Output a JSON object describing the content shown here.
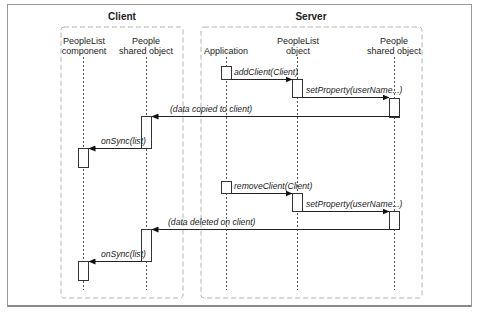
{
  "diagram": {
    "type": "sequence",
    "groups": [
      {
        "id": "client",
        "title": "Client"
      },
      {
        "id": "server",
        "title": "Server"
      }
    ],
    "lifelines": [
      {
        "id": "peoplelist_component",
        "group": "client",
        "label_line1": "PeopleList",
        "label_line2": "component"
      },
      {
        "id": "client_people",
        "group": "client",
        "label_line1": "People",
        "label_line2": "shared object"
      },
      {
        "id": "application",
        "group": "server",
        "label_line1": "Application",
        "label_line2": ""
      },
      {
        "id": "peoplelist_object",
        "group": "server",
        "label_line1": "PeopleList",
        "label_line2": "object"
      },
      {
        "id": "server_people",
        "group": "server",
        "label_line1": "People",
        "label_line2": "shared object"
      }
    ],
    "messages": [
      {
        "from": "application",
        "to": "peoplelist_object",
        "label": "addClient(Client)"
      },
      {
        "from": "peoplelist_object",
        "to": "server_people",
        "label": "setProperty(userName...)"
      },
      {
        "from": "server_people",
        "to": "client_people",
        "label": "(data copied to client)"
      },
      {
        "from": "client_people",
        "to": "peoplelist_component",
        "label": "onSync(list)"
      },
      {
        "from": "application",
        "to": "peoplelist_object",
        "label": "removeClient(Client)"
      },
      {
        "from": "peoplelist_object",
        "to": "server_people",
        "label": "setProperty(userName...)"
      },
      {
        "from": "server_people",
        "to": "client_people",
        "label": "(data deleted on client)"
      },
      {
        "from": "client_people",
        "to": "peoplelist_component",
        "label": "onSync(list)"
      }
    ]
  }
}
